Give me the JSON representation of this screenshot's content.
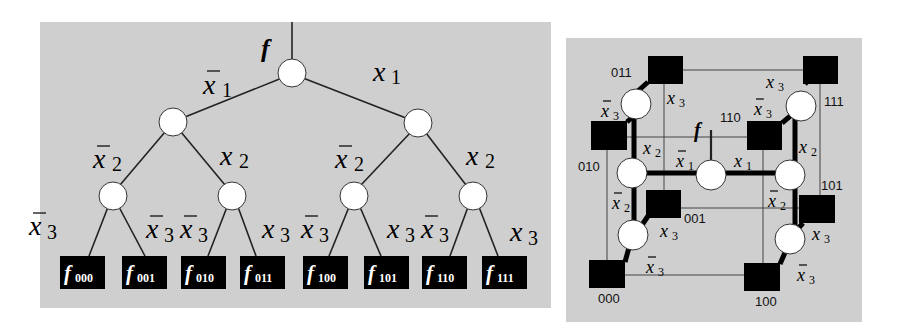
{
  "tree": {
    "root_label": "f",
    "edge_labels": {
      "l1_left": {
        "var": "x",
        "sub": "1",
        "neg": true
      },
      "l1_right": {
        "var": "x",
        "sub": "1",
        "neg": false
      },
      "l2_ll": {
        "var": "x",
        "sub": "2",
        "neg": true
      },
      "l2_lr": {
        "var": "x",
        "sub": "2",
        "neg": false
      },
      "l2_rl": {
        "var": "x",
        "sub": "2",
        "neg": true
      },
      "l2_rr": {
        "var": "x",
        "sub": "2",
        "neg": false
      },
      "l3": [
        {
          "var": "x",
          "sub": "3",
          "neg": true
        },
        {
          "var": "x",
          "sub": "3",
          "neg": true
        },
        {
          "var": "x",
          "sub": "3",
          "neg": true
        },
        {
          "var": "x",
          "sub": "3",
          "neg": false
        },
        {
          "var": "x",
          "sub": "3",
          "neg": true
        },
        {
          "var": "x",
          "sub": "3",
          "neg": false
        },
        {
          "var": "x",
          "sub": "3",
          "neg": true
        },
        {
          "var": "x",
          "sub": "3",
          "neg": false
        }
      ]
    },
    "leaves": [
      {
        "f": "f",
        "sub": "000"
      },
      {
        "f": "f",
        "sub": "001"
      },
      {
        "f": "f",
        "sub": "010"
      },
      {
        "f": "f",
        "sub": "011"
      },
      {
        "f": "f",
        "sub": "100"
      },
      {
        "f": "f",
        "sub": "101"
      },
      {
        "f": "f",
        "sub": "110"
      },
      {
        "f": "f",
        "sub": "111"
      }
    ]
  },
  "cube": {
    "root_label": "f",
    "corner_codes": {
      "c011": "011",
      "c111": "111",
      "c010": "010",
      "c110": "110",
      "c001": "001",
      "c101": "101",
      "c000": "000",
      "c100": "100"
    },
    "edge_labels": {
      "x1_left": {
        "var": "x",
        "sub": "1",
        "neg": true
      },
      "x1_right": {
        "var": "x",
        "sub": "1",
        "neg": false
      },
      "x2_left_up": {
        "var": "x",
        "sub": "2",
        "neg": false
      },
      "x2_left_down": {
        "var": "x",
        "sub": "2",
        "neg": true
      },
      "x2_right_up": {
        "var": "x",
        "sub": "2",
        "neg": false
      },
      "x2_right_down": {
        "var": "x",
        "sub": "2",
        "neg": true
      },
      "x3_tl_pos": {
        "var": "x",
        "sub": "3",
        "neg": false
      },
      "x3_tl_neg": {
        "var": "x",
        "sub": "3",
        "neg": true
      },
      "x3_tr_pos": {
        "var": "x",
        "sub": "3",
        "neg": false
      },
      "x3_tr_neg": {
        "var": "x",
        "sub": "3",
        "neg": true
      },
      "x3_bl_pos": {
        "var": "x",
        "sub": "3",
        "neg": false
      },
      "x3_bl_neg": {
        "var": "x",
        "sub": "3",
        "neg": true
      },
      "x3_br_pos": {
        "var": "x",
        "sub": "3",
        "neg": false
      },
      "x3_br_neg": {
        "var": "x",
        "sub": "3",
        "neg": true
      }
    }
  },
  "colors": {
    "panel_bg": "#cfcfcf",
    "node_fill": "#ffffff",
    "leaf_fill": "#000000",
    "line": "#222222"
  }
}
